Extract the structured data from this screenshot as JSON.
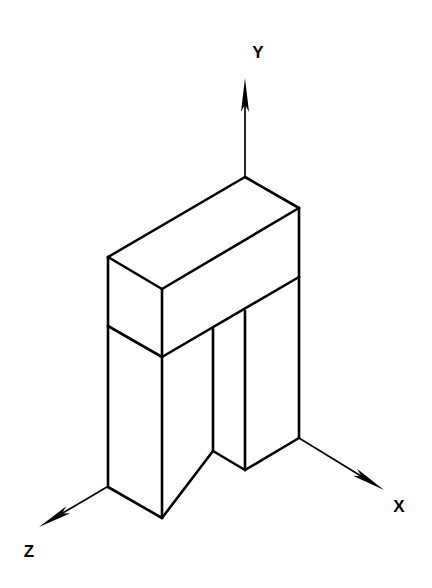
{
  "figure": {
    "background_color": "#ffffff",
    "line_color": "#000000",
    "canvas": {
      "width": 432,
      "height": 588
    },
    "projection": "isometric",
    "axes": [
      {
        "id": "y-axis",
        "label": "Y",
        "direction": "up",
        "origin": [
          245,
          177
        ],
        "tip": [
          245,
          78
        ],
        "label_position": [
          258,
          58
        ]
      },
      {
        "id": "x-axis",
        "label": "X",
        "direction": "lower-right",
        "origin": [
          299,
          438
        ],
        "tip": [
          384,
          490
        ],
        "label_position": [
          399,
          512
        ]
      },
      {
        "id": "z-axis",
        "label": "Z",
        "direction": "lower-left",
        "origin": [
          107,
          487
        ],
        "tip": [
          39,
          527
        ],
        "label_position": [
          29,
          557
        ]
      }
    ],
    "solid": {
      "name": "slotted-block",
      "description": "Rectangular block with a vertical rectangular slot cut up from the bottom face",
      "vertices": {
        "top_back": [
          245,
          177
        ],
        "top_right": [
          299,
          208
        ],
        "top_left": [
          108,
          257
        ],
        "top_front": [
          162,
          289
        ],
        "slab_left": [
          108,
          326
        ],
        "slab_front": [
          162,
          357
        ],
        "slab_right": [
          299,
          277
        ],
        "left_leg_front_bottom": [
          162,
          518
        ],
        "left_leg_left_bottom": [
          108,
          487
        ],
        "left_leg_inner_bottom": [
          213,
          451
        ],
        "slot_bottom_v": [
          245,
          470
        ],
        "right_leg_right_bottom": [
          299,
          438
        ],
        "right_leg_inner_top": [
          213,
          329
        ],
        "slot_inner_edge_top": [
          245,
          311
        ]
      },
      "edges": [
        [
          "top_back",
          "top_right"
        ],
        [
          "top_back",
          "top_left"
        ],
        [
          "top_left",
          "top_front"
        ],
        [
          "top_front",
          "top_right"
        ],
        [
          "top_left",
          "slab_left"
        ],
        [
          "top_front",
          "slab_front"
        ],
        [
          "top_right",
          "slab_right"
        ],
        [
          "slab_left",
          "slab_front"
        ],
        [
          "slab_front",
          "slab_right"
        ],
        [
          "slab_left",
          "left_leg_left_bottom"
        ],
        [
          "slab_front",
          "left_leg_front_bottom"
        ],
        [
          "left_leg_left_bottom",
          "left_leg_front_bottom"
        ],
        [
          "left_leg_front_bottom",
          "left_leg_inner_bottom"
        ],
        [
          "left_leg_inner_bottom",
          "right_leg_inner_top"
        ],
        [
          "left_leg_inner_bottom",
          "slot_bottom_v"
        ],
        [
          "slot_bottom_v",
          "slot_inner_edge_top"
        ],
        [
          "slot_bottom_v",
          "right_leg_right_bottom"
        ],
        [
          "right_leg_right_bottom",
          "slab_right"
        ]
      ]
    }
  }
}
